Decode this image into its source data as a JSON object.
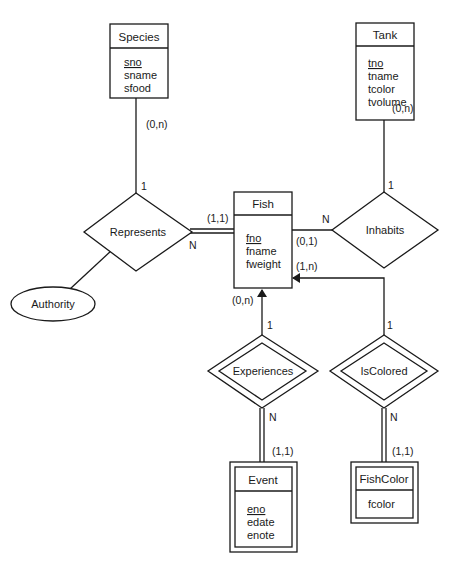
{
  "entities": {
    "species": {
      "name": "Species",
      "attributes": [
        "sno",
        "sname",
        "sfood"
      ],
      "key": "sno"
    },
    "tank": {
      "name": "Tank",
      "attributes": [
        "tno",
        "tname",
        "tcolor",
        "tvolume"
      ],
      "key": "tno"
    },
    "fish": {
      "name": "Fish",
      "attributes": [
        "fno",
        "fname",
        "fweight"
      ],
      "key": "fno"
    },
    "event": {
      "name": "Event",
      "attributes": [
        "eno",
        "edate",
        "enote"
      ],
      "key": "eno",
      "weak": true
    },
    "fishcolor": {
      "name": "FishColor",
      "attributes": [
        "fcolor"
      ],
      "weak": true
    }
  },
  "relationships": {
    "represents": {
      "name": "Represents"
    },
    "inhabits": {
      "name": "Inhabits"
    },
    "experiences": {
      "name": "Experiences",
      "identifying": true
    },
    "iscolored": {
      "name": "IsColored",
      "identifying": true
    }
  },
  "attributes_standalone": {
    "authority": {
      "name": "Authority"
    }
  },
  "cardinalities": {
    "species_represents_min_max": "(0,n)",
    "represents_species_ratio": "1",
    "represents_fish_ratio": "N",
    "fish_represents_min_max": "(1,1)",
    "tank_inhabits_min_max": "(0,n)",
    "inhabits_tank_ratio": "1",
    "inhabits_fish_ratio": "N",
    "fish_inhabits_min_max": "(0,1)",
    "fish_iscolored_min_max": "(1,n)",
    "fish_experiences_min_max": "(0,n)",
    "experiences_fish_ratio": "1",
    "experiences_event_ratio": "N",
    "event_experiences_min_max": "(1,1)",
    "iscolored_fish_ratio": "1",
    "iscolored_fishcolor_ratio": "N",
    "fishcolor_iscolored_min_max": "(1,1)"
  }
}
